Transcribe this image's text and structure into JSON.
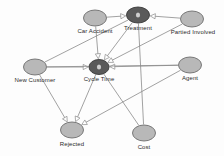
{
  "diagram": {
    "type": "directed-acyclic-graph",
    "background_color": "#fdfdfd",
    "node_fill": "#b8b8b8",
    "node_stroke": "#6e6e6e",
    "intervention_fill": "#5a5a5a",
    "intervention_stroke": "#3a3a3a",
    "edge_color": "#8a8a8a",
    "label_color": "#2b2b2b"
  },
  "nodes": [
    {
      "id": "car_accident",
      "label": "Car Accident",
      "cx": 95,
      "cy": 18,
      "rx": 11.5,
      "ry": 8,
      "label_x": 95,
      "label_y": 28,
      "kind": "observed"
    },
    {
      "id": "treatment",
      "label": "Treatment",
      "cx": 138,
      "cy": 15,
      "rx": 11.5,
      "ry": 8,
      "label_x": 138,
      "label_y": 25,
      "kind": "intervention"
    },
    {
      "id": "partied_involved",
      "label": "Partied Involved",
      "cx": 192,
      "cy": 19,
      "rx": 11.5,
      "ry": 8,
      "label_x": 193,
      "label_y": 29,
      "kind": "observed"
    },
    {
      "id": "new_customer",
      "label": "New Customer",
      "cx": 35,
      "cy": 67,
      "rx": 11.5,
      "ry": 8,
      "label_x": 35,
      "label_y": 77,
      "kind": "observed"
    },
    {
      "id": "cycle_time",
      "label": "Cycle Time",
      "cx": 99,
      "cy": 67,
      "rx": 10,
      "ry": 7.5,
      "label_x": 99,
      "label_y": 76,
      "kind": "intervention"
    },
    {
      "id": "agent",
      "label": "Agent",
      "cx": 190,
      "cy": 65,
      "rx": 11.5,
      "ry": 8,
      "label_x": 190,
      "label_y": 75,
      "kind": "observed"
    },
    {
      "id": "rejected",
      "label": "Rejected",
      "cx": 72,
      "cy": 130,
      "rx": 11.5,
      "ry": 8,
      "label_x": 72,
      "label_y": 141,
      "kind": "observed"
    },
    {
      "id": "cost",
      "label": "Cost",
      "cx": 144,
      "cy": 133,
      "rx": 11.5,
      "ry": 8,
      "label_x": 144,
      "label_y": 144,
      "kind": "observed"
    }
  ],
  "edges": [
    {
      "id": "e1",
      "from": "car_accident",
      "to": "treatment",
      "arrow": true
    },
    {
      "id": "e2",
      "from": "car_accident",
      "to": "cycle_time",
      "arrow": true
    },
    {
      "id": "e3",
      "from": "partied_involved",
      "to": "treatment",
      "arrow": true
    },
    {
      "id": "e4",
      "from": "partied_involved",
      "to": "cycle_time",
      "arrow": true
    },
    {
      "id": "e5",
      "from": "treatment",
      "to": "cycle_time",
      "arrow": true
    },
    {
      "id": "e6",
      "from": "new_customer",
      "to": "cycle_time",
      "arrow": true
    },
    {
      "id": "e7",
      "from": "new_customer",
      "to": "treatment",
      "arrow": false
    },
    {
      "id": "e8",
      "from": "new_customer",
      "to": "rejected",
      "arrow": true
    },
    {
      "id": "e9",
      "from": "agent",
      "to": "cycle_time",
      "arrow": true
    },
    {
      "id": "e10",
      "from": "agent",
      "to": "rejected",
      "arrow": true
    },
    {
      "id": "e11",
      "from": "cycle_time",
      "to": "rejected",
      "arrow": true
    },
    {
      "id": "e12",
      "from": "cycle_time",
      "to": "cost",
      "arrow": false
    },
    {
      "id": "e13",
      "from": "treatment",
      "to": "cost",
      "arrow": false
    },
    {
      "id": "e14",
      "from": "new_customer",
      "to": "agent",
      "arrow": false
    }
  ]
}
